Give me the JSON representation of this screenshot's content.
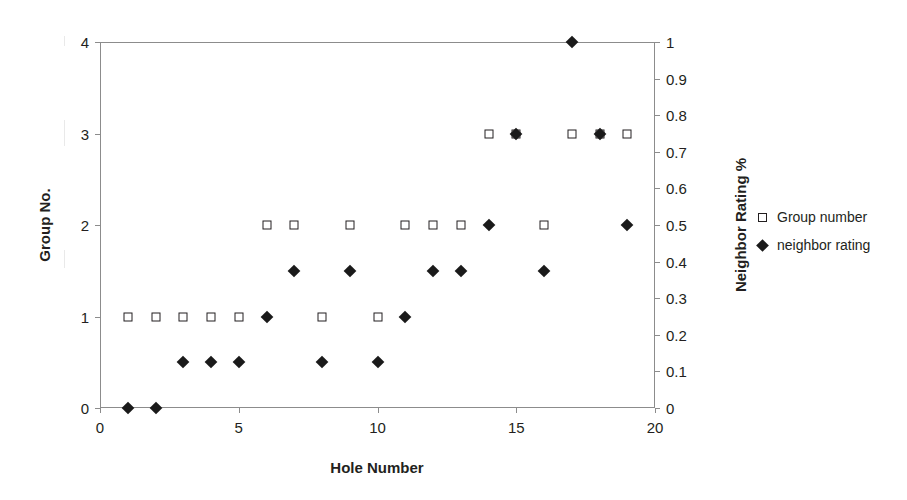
{
  "chart_data": {
    "type": "scatter",
    "title": "",
    "xlabel": "Hole Number",
    "ylabel": "Group No.",
    "y2label": "Neighbor Rating %",
    "xlim": [
      0,
      20
    ],
    "ylim": [
      0,
      4
    ],
    "y2lim": [
      0,
      1
    ],
    "grid": false,
    "legend_position": "right",
    "x_ticks": [
      "0",
      "5",
      "10",
      "15",
      "20"
    ],
    "x_tick_values": [
      0,
      5,
      10,
      15,
      20
    ],
    "y_ticks": [
      "0",
      "1",
      "2",
      "3",
      "4"
    ],
    "y_tick_values": [
      0,
      1,
      2,
      3,
      4
    ],
    "y2_ticks": [
      "0",
      "0.1",
      "0.2",
      "0.3",
      "0.4",
      "0.5",
      "0.6",
      "0.7",
      "0.8",
      "0.9",
      "1"
    ],
    "y2_tick_values": [
      0,
      0.1,
      0.2,
      0.3,
      0.4,
      0.5,
      0.6,
      0.7,
      0.8,
      0.9,
      1
    ],
    "x": [
      1,
      2,
      3,
      4,
      5,
      6,
      7,
      8,
      9,
      10,
      11,
      12,
      13,
      14,
      15,
      16,
      17,
      18,
      19
    ],
    "series": [
      {
        "name": "Group number",
        "marker": "open-square",
        "axis": "left",
        "values": [
          1,
          1,
          1,
          1,
          1,
          2,
          2,
          1,
          2,
          1,
          2,
          2,
          2,
          3,
          3,
          2,
          3,
          3,
          3
        ]
      },
      {
        "name": "neighbor rating",
        "marker": "filled-diamond",
        "axis": "right",
        "values": [
          0,
          0,
          0.125,
          0.125,
          0.125,
          0.25,
          0.375,
          0.125,
          0.375,
          0.125,
          0.25,
          0.375,
          0.375,
          0.5,
          0.75,
          0.375,
          1,
          0.75,
          0.5
        ]
      }
    ],
    "colors": {
      "marker_stroke": "#231f20",
      "marker_fill": "#1a1a1a",
      "axis": "#8c8c8c",
      "background": "#ffffff"
    }
  },
  "legend": {
    "items": [
      {
        "label": "Group number",
        "marker": "open-square"
      },
      {
        "label": "neighbor rating",
        "marker": "filled-diamond"
      }
    ]
  },
  "axes": {
    "x_title": "Hole Number",
    "y_left_title": "Group No.",
    "y_right_title": "Neighbor Rating %"
  }
}
